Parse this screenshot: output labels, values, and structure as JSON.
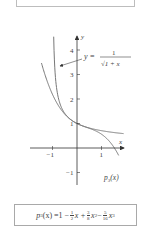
{
  "figure": {
    "axis_labels": {
      "x": "x",
      "y": "y"
    },
    "x_ticks": [
      {
        "value": -1,
        "label": "−1"
      },
      {
        "value": 1,
        "label": "1"
      }
    ],
    "y_ticks": [
      {
        "value": 4,
        "label": "4"
      },
      {
        "value": 3,
        "label": "3"
      },
      {
        "value": 2,
        "label": "2"
      },
      {
        "value": 1,
        "label": "1"
      },
      {
        "value": -1,
        "label": "−1"
      }
    ],
    "annotation_function": {
      "prefix": "y =",
      "numerator": "1",
      "denominator": "√1 + x"
    },
    "annotation_polynomial": "p₃(x)",
    "colors": {
      "curve": "#777777",
      "axis": "#333333"
    }
  },
  "formula": {
    "lhs": "p",
    "lhs_sub": "3",
    "lhs_arg": "(x) = ",
    "t0": "1 − ",
    "f1_num": "1",
    "f1_den": "2",
    "t1": "x + ",
    "f2_num": "3",
    "f2_den": "8",
    "t2": "x",
    "t2_exp": "2",
    "t3": " − ",
    "f3_num": "5",
    "f3_den": "16",
    "t4": "x",
    "t4_exp": "3"
  }
}
